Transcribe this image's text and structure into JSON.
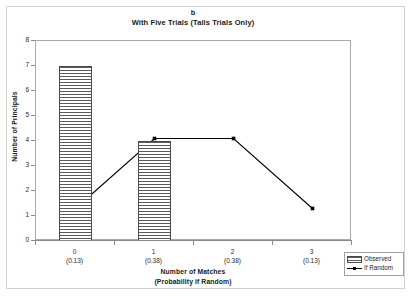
{
  "figure": {
    "panel_label": "b",
    "title_line1": "b",
    "title_line2": "With Five Trials (Tails Trials Only)"
  },
  "axes": {
    "y_title": "Number of Principals",
    "x_title_line1": "Number of Matches",
    "x_title_line2": "(Probability if Random)",
    "y_ticks": [
      "0",
      "1",
      "2",
      "3",
      "4",
      "5",
      "6",
      "7",
      "8"
    ]
  },
  "legend": {
    "items": [
      {
        "label": "Observed",
        "key": "bar-key",
        "color": "#5a5a5a"
      },
      {
        "label": "If Random",
        "key": "line-key",
        "color": "#000000"
      }
    ]
  },
  "chart_data": {
    "type": "bar",
    "title": "b\nWith Five Trials (Tails Trials Only)",
    "subtitle": "With Five Trials (Tails Trials Only)",
    "xlabel": "Number of Matches (Probability if Random)",
    "ylabel": "Number of Principals",
    "categories": [
      "0",
      "1",
      "2",
      "3"
    ],
    "category_sublabels": [
      "(0.13)",
      "(0.38)",
      "(0.38)",
      "(0.13)"
    ],
    "probabilities_if_random": [
      0.13,
      0.38,
      0.38,
      0.13
    ],
    "ylim": [
      0,
      8
    ],
    "ytick_step": 1,
    "grid": false,
    "legend_position": "bottom-right",
    "series": [
      {
        "name": "Observed",
        "type": "bar",
        "values": [
          7,
          4,
          0,
          0
        ]
      },
      {
        "name": "If Random",
        "type": "line",
        "marker": "square",
        "values": [
          1.3,
          4.1,
          4.1,
          1.3
        ]
      }
    ]
  }
}
